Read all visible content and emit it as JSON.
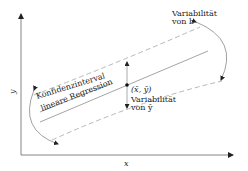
{
  "diagram": {
    "axes": {
      "x_label": "x",
      "y_label": "y"
    },
    "labels": {
      "confidence_interval": "Konfidenzinterval",
      "linear_regression": "lineare Regression",
      "mean_point": "(x̄, ȳ)",
      "variability_b_line1": "Variabilität",
      "variability_b_line2": "von b",
      "variability_y_line1": "Variabilität",
      "variability_y_line2": "von ȳ"
    },
    "colors": {
      "axis": "#555555",
      "regression_line": "#9a9a9a",
      "confidence_band": "#b8b8b8",
      "arrow": "#333333",
      "text": "#222222"
    }
  }
}
